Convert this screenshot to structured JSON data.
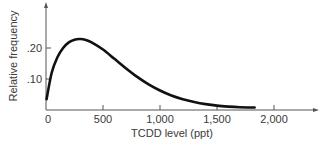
{
  "chart_data": {
    "type": "line",
    "title": "",
    "xlabel": "TCDD level (ppt)",
    "ylabel": "Relative frequency",
    "xlim": [
      0,
      2350
    ],
    "ylim": [
      0,
      0.33
    ],
    "grid": false,
    "legend": null,
    "x_ticks": [
      0,
      500,
      1000,
      1500,
      2000
    ],
    "x_tick_labels": [
      "0",
      "500",
      "1,000",
      "1,500",
      "2,000"
    ],
    "y_ticks": [
      0.1,
      0.2
    ],
    "y_tick_labels": [
      ".10",
      ".20"
    ],
    "series": [
      {
        "name": "TCDD distribution",
        "x": [
          5,
          50,
          100,
          150,
          200,
          250,
          300,
          350,
          400,
          500,
          600,
          700,
          800,
          900,
          1000,
          1100,
          1200,
          1300,
          1400,
          1500,
          1600,
          1700,
          1830
        ],
        "values": [
          0.035,
          0.12,
          0.17,
          0.2,
          0.218,
          0.227,
          0.229,
          0.226,
          0.218,
          0.195,
          0.165,
          0.135,
          0.107,
          0.083,
          0.063,
          0.047,
          0.035,
          0.026,
          0.019,
          0.014,
          0.011,
          0.009,
          0.008
        ]
      }
    ]
  },
  "axes": {
    "x_label": "TCDD level (ppt)",
    "y_label": "Relative frequency"
  },
  "colors": {
    "curve": "#111111",
    "axis": "#555555",
    "text": "#3a3a3a"
  }
}
